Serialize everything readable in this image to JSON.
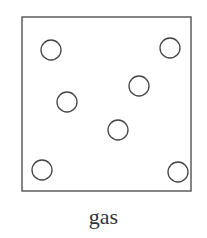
{
  "diagram": {
    "label": "gas",
    "container": {
      "x": 22,
      "y": 17,
      "width": 169,
      "height": 174
    },
    "particles": [
      {
        "cx": 51,
        "cy": 50,
        "r": 10
      },
      {
        "cx": 170,
        "cy": 48,
        "r": 10
      },
      {
        "cx": 67,
        "cy": 102,
        "r": 10
      },
      {
        "cx": 139,
        "cy": 86,
        "r": 10
      },
      {
        "cx": 118,
        "cy": 130,
        "r": 10
      },
      {
        "cx": 42,
        "cy": 170,
        "r": 10
      },
      {
        "cx": 178,
        "cy": 172,
        "r": 10
      }
    ],
    "stroke_color": "#444444"
  }
}
